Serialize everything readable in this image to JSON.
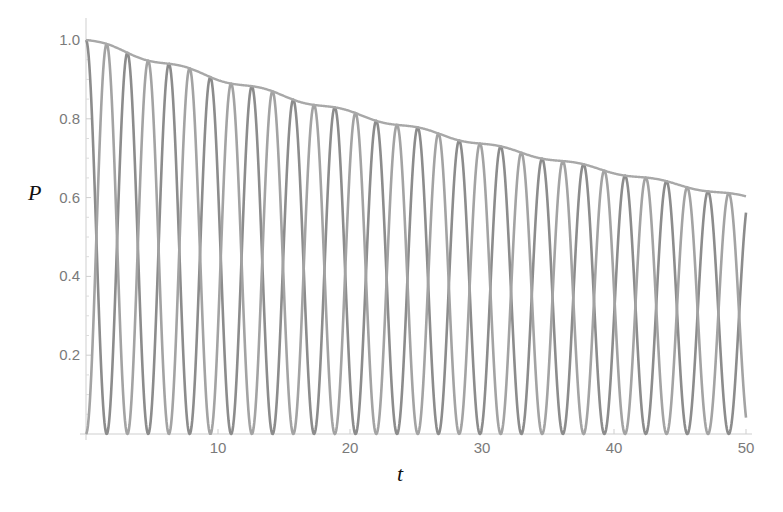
{
  "chart_data": {
    "type": "line",
    "title": "",
    "xlabel": "t",
    "ylabel": "P",
    "xlim": [
      0,
      50
    ],
    "ylim": [
      0,
      1.0
    ],
    "grid": false,
    "legend": null,
    "x_ticks": [
      10,
      20,
      30,
      40,
      50
    ],
    "y_ticks": [
      0.2,
      0.4,
      0.6,
      0.8,
      1.0
    ],
    "y_tick_labels": [
      "0.2",
      "0.4",
      "0.6",
      "0.8",
      "1.0"
    ],
    "x_tick_labels": [
      "10",
      "20",
      "30",
      "40",
      "50"
    ],
    "series": [
      {
        "name": "P1 (starts at 1, oscillating)",
        "color": "#8c8c8c",
        "model": "exp(-0.0102 t) * cos^2(t)",
        "sample_points": [
          [
            0,
            1.0
          ],
          [
            1.57,
            0.0
          ],
          [
            3.14,
            0.97
          ],
          [
            4.71,
            0.0
          ],
          [
            6.28,
            0.94
          ],
          [
            10,
            0.63
          ],
          [
            20,
            0.14
          ],
          [
            25,
            0.77
          ],
          [
            30,
            0.02
          ],
          [
            40,
            0.31
          ],
          [
            50,
            0.56
          ]
        ]
      },
      {
        "name": "P2 (starts at 0, oscillating)",
        "color": "#a3a3a3",
        "model": "exp(-0.0102 t) * sin^2(t)",
        "sample_points": [
          [
            0,
            0.0
          ],
          [
            1.57,
            0.98
          ],
          [
            3.14,
            0.0
          ],
          [
            4.71,
            0.95
          ],
          [
            6.28,
            0.0
          ],
          [
            10,
            0.27
          ],
          [
            20,
            0.68
          ],
          [
            25,
            0.0
          ],
          [
            30,
            0.72
          ],
          [
            40,
            0.36
          ],
          [
            50,
            0.04
          ]
        ]
      },
      {
        "name": "Envelope (P1 + P2)",
        "color": "#a8a8a8",
        "model": "exp(-0.0102 t) with slight ripple",
        "sample_points": [
          [
            0,
            1.0
          ],
          [
            5,
            0.95
          ],
          [
            10,
            0.9
          ],
          [
            15,
            0.86
          ],
          [
            20,
            0.82
          ],
          [
            25,
            0.775
          ],
          [
            30,
            0.735
          ],
          [
            35,
            0.7
          ],
          [
            40,
            0.665
          ],
          [
            45,
            0.63
          ],
          [
            50,
            0.6
          ]
        ]
      }
    ],
    "params": {
      "gamma": 0.0102,
      "omega": 1.0,
      "ripple_amp": 0.006,
      "ripple_omega": 1.05
    }
  },
  "axes": {
    "x_label": "t",
    "y_label": "P"
  }
}
